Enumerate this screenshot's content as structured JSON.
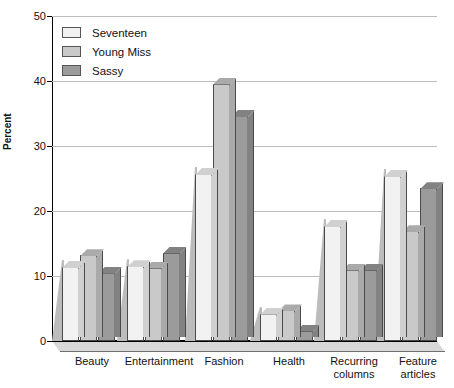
{
  "chart_data": {
    "type": "bar",
    "title": "",
    "xlabel": "",
    "ylabel": "Percent",
    "ylim": [
      0,
      50
    ],
    "yticks": [
      0,
      10,
      20,
      30,
      40,
      50
    ],
    "grid": true,
    "legend_position": "top-left",
    "categories": [
      "Beauty",
      "Entertainment",
      "Fashion",
      "Health",
      "Recurring columns",
      "Feature articles"
    ],
    "series": [
      {
        "name": "Seventeen",
        "color": "#f2f2f2",
        "values": [
          11.4,
          11.5,
          25.7,
          4.2,
          17.7,
          25.4
        ]
      },
      {
        "name": "Young Miss",
        "color": "#c9c9c9",
        "values": [
          13.2,
          11.3,
          39.6,
          4.7,
          11.0,
          16.9
        ]
      },
      {
        "name": "Sassy",
        "color": "#9b9b9b",
        "values": [
          10.5,
          13.6,
          34.6,
          1.6,
          11.0,
          23.5
        ]
      }
    ]
  },
  "axis": {
    "ylabel": "Percent",
    "tick_labels": [
      "50",
      "40",
      "30",
      "20",
      "10",
      "0"
    ],
    "category_labels": [
      {
        "line1": "Beauty",
        "line2": ""
      },
      {
        "line1": "Entertainment",
        "line2": ""
      },
      {
        "line1": "Fashion",
        "line2": ""
      },
      {
        "line1": "Health",
        "line2": ""
      },
      {
        "line1": "Recurring",
        "line2": "columns"
      },
      {
        "line1": "Feature",
        "line2": "articles"
      }
    ]
  },
  "legend": {
    "items": [
      {
        "label": "Seventeen",
        "color": "#f2f2f2"
      },
      {
        "label": "Young Miss",
        "color": "#c9c9c9"
      },
      {
        "label": "Sassy",
        "color": "#9b9b9b"
      }
    ]
  }
}
